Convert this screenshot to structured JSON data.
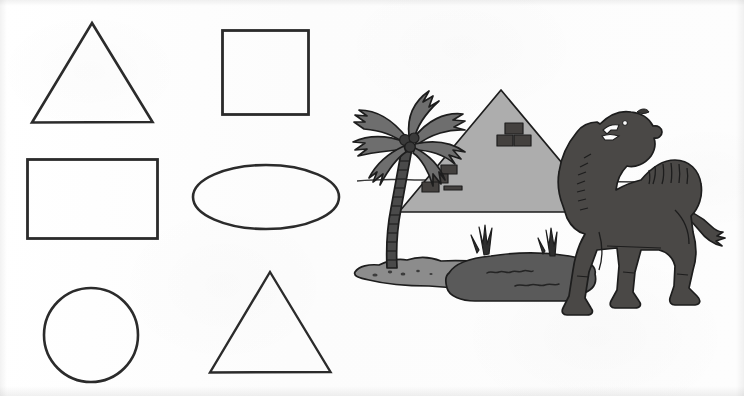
{
  "page": {
    "background_color": "#fdfdfd",
    "width": 744,
    "height": 396
  },
  "palette": {
    "outline": "#2b2b2b",
    "pyramid_fill": "#adadad",
    "pyramid_outline": "#262626",
    "sand_fill": "#8c8c8c",
    "pond_fill": "#5a5a5a",
    "palm_frond_fill": "#6e6e6e",
    "palm_trunk_fill": "#4a4a4a",
    "camel_fill": "#4a4846",
    "block_fill": "#44413f",
    "paper": "#ffffff"
  },
  "shapes_panel": {
    "label": "geometric-shapes",
    "items": [
      {
        "id": "triangle-top-left",
        "name": "Triangle",
        "kind": "triangle",
        "fill": "none",
        "stroke": "#2b2b2b",
        "stroke_width": 2.4,
        "bounds": {
          "x": 32,
          "y": 23,
          "w": 120,
          "h": 99
        },
        "points": "92,23 152,122 32,122"
      },
      {
        "id": "square-top-right",
        "name": "Square",
        "kind": "square",
        "fill": "none",
        "stroke": "#2b2b2b",
        "stroke_width": 2.4,
        "bounds": {
          "x": 222,
          "y": 30,
          "w": 86,
          "h": 84
        }
      },
      {
        "id": "rectangle-middle-left",
        "name": "Rectangle",
        "kind": "rectangle",
        "fill": "none",
        "stroke": "#2b2b2b",
        "stroke_width": 2.4,
        "bounds": {
          "x": 27,
          "y": 159,
          "w": 130,
          "h": 79
        }
      },
      {
        "id": "ellipse-middle-right",
        "name": "Ellipse",
        "kind": "ellipse",
        "fill": "none",
        "stroke": "#2b2b2b",
        "stroke_width": 2.4,
        "center": {
          "cx": 266,
          "cy": 197
        },
        "radii": {
          "rx": 73,
          "ry": 32
        }
      },
      {
        "id": "circle-bottom-left",
        "name": "Circle",
        "kind": "circle",
        "fill": "none",
        "stroke": "#2b2b2b",
        "stroke_width": 2.4,
        "center": {
          "cx": 91,
          "cy": 335
        },
        "radii": {
          "r": 47
        }
      },
      {
        "id": "triangle-bottom-right",
        "name": "Triangle",
        "kind": "triangle",
        "fill": "none",
        "stroke": "#2b2b2b",
        "stroke_width": 2.4,
        "bounds": {
          "x": 210,
          "y": 272,
          "w": 120,
          "h": 100
        },
        "points": "270,272 330,372 210,372"
      }
    ]
  },
  "scene_panel": {
    "label": "desert-oasis-illustration",
    "description": "Desert oasis clip-art with palm tree, pyramid, pond and camel",
    "elements": [
      {
        "id": "palm-tree",
        "name": "Palm tree",
        "fill": "#6e6e6e",
        "trunk_fill": "#4a4a4a",
        "coconuts": 3
      },
      {
        "id": "pyramid",
        "name": "Pyramid",
        "fill": "#adadad",
        "stroke": "#262626",
        "blocks": 5
      },
      {
        "id": "horizon-line",
        "name": "Horizon line",
        "stroke": "#3a3a3a"
      },
      {
        "id": "sand-patch",
        "name": "Sand patch",
        "fill": "#8c8c8c"
      },
      {
        "id": "pond",
        "name": "Water pond",
        "fill": "#5a5a5a"
      },
      {
        "id": "grass-tuft-left",
        "name": "Grass tuft",
        "fill": "#3a3a3a"
      },
      {
        "id": "grass-tuft-right",
        "name": "Grass tuft",
        "fill": "#3a3a3a"
      },
      {
        "id": "camel",
        "name": "Camel",
        "fill": "#4a4846",
        "humps": 1
      }
    ]
  }
}
